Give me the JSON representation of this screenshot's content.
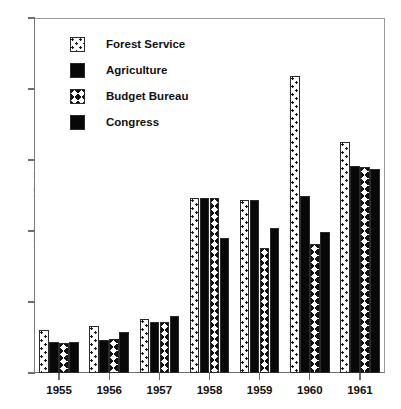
{
  "chart_data": {
    "type": "bar",
    "title": "",
    "xlabel": "",
    "ylabel": "Millions of Dollars",
    "categories": [
      "1955",
      "1956",
      "1957",
      "1958",
      "1959",
      "1960",
      "1961"
    ],
    "series": [
      {
        "name": "Forest Service",
        "pattern": "dots",
        "values": [
          3.0,
          3.3,
          3.8,
          12.3,
          12.2,
          20.9,
          16.3
        ]
      },
      {
        "name": "Agriculture",
        "pattern": "solid",
        "values": [
          2.2,
          2.3,
          3.6,
          12.3,
          12.2,
          12.5,
          14.6
        ]
      },
      {
        "name": "Budget Bureau",
        "pattern": "chev",
        "values": [
          2.1,
          2.4,
          3.6,
          12.3,
          8.8,
          9.1,
          14.5
        ]
      },
      {
        "name": "Congress",
        "pattern": "solid",
        "values": [
          2.2,
          2.9,
          4.0,
          9.5,
          10.2,
          9.9,
          14.4
        ]
      }
    ],
    "yticks": [
      0,
      5,
      10,
      15,
      20,
      25
    ],
    "ylim": [
      0,
      25
    ],
    "grid": false,
    "legend_position": "top-left",
    "legend": [
      "Forest Service",
      "Agriculture",
      "Budget Bureau",
      "Congress"
    ]
  },
  "legend": {
    "items": [
      {
        "label": "Forest Service",
        "swatch": "dotted-square-icon"
      },
      {
        "label": "Agriculture",
        "swatch": "solid-square-icon"
      },
      {
        "label": "Budget Bureau",
        "swatch": "chevron-square-icon"
      },
      {
        "label": "Congress",
        "swatch": "solid-square-icon"
      }
    ]
  },
  "colors": {
    "ink": "#111111",
    "bar_fill_solid": "#080808",
    "bar_outline": "#2b2b2b",
    "axis": "#6f6f6f",
    "background": "#ffffff"
  }
}
